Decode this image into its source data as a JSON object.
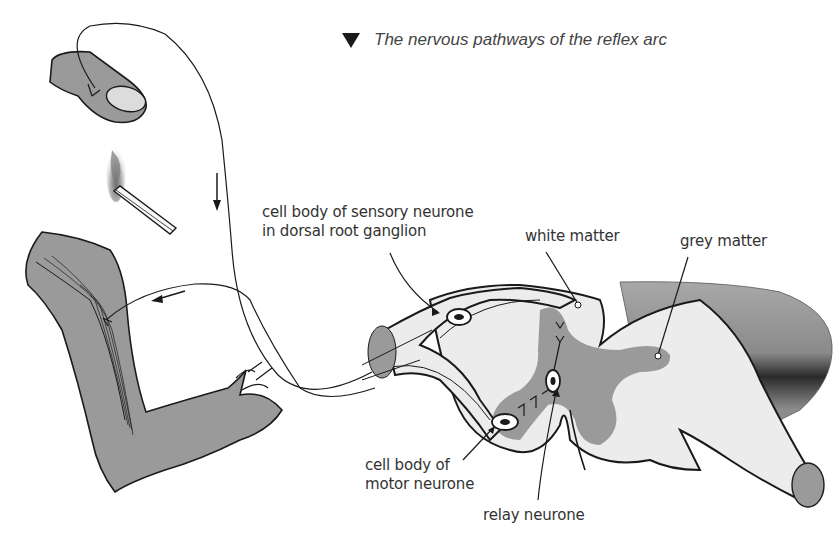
{
  "title": {
    "marker_icon": "down-triangle",
    "text": "The nervous pathways of the reflex arc"
  },
  "labels": {
    "sensory_cell_body": {
      "line1": "cell  body of sensory  neurone",
      "line2": "in dorsal root ganglion"
    },
    "white_matter": "white matter",
    "grey_matter": "grey matter",
    "motor_cell_body": {
      "line1": "cell body of",
      "line2": "motor neurone"
    },
    "relay_neurone": "relay neurone"
  },
  "colors": {
    "tissue_grey": "#9a9a9a",
    "white_matter": "#ececec",
    "outline": "#1a1a1a",
    "text": "#333333"
  }
}
